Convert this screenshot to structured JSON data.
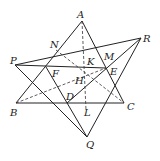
{
  "diagram": {
    "labels": {
      "A": "A",
      "R": "R",
      "N": "N",
      "M": "M",
      "P": "P",
      "K": "K",
      "E": "E",
      "F": "F",
      "H": "H",
      "D": "D",
      "B": "B",
      "L": "L",
      "C": "C",
      "Q": "Q"
    },
    "points": {
      "A": [
        82,
        21
      ],
      "R": [
        141,
        38
      ],
      "P": [
        15,
        65
      ],
      "N": [
        56,
        50
      ],
      "M": [
        106,
        62
      ],
      "K": [
        87,
        66
      ],
      "E": [
        106,
        68
      ],
      "F": [
        46,
        67
      ],
      "H": [
        86,
        76
      ],
      "D": [
        67,
        103
      ],
      "B": [
        16,
        103
      ],
      "L": [
        86,
        103
      ],
      "C": [
        124,
        103
      ],
      "Q": [
        87,
        137
      ]
    },
    "solid_segments": [
      [
        "A",
        "B"
      ],
      [
        "A",
        "C"
      ],
      [
        "B",
        "C"
      ],
      [
        "P",
        "R"
      ],
      [
        "P",
        "E"
      ],
      [
        "P",
        "Q"
      ],
      [
        "R",
        "D"
      ],
      [
        "R",
        "Q"
      ],
      [
        "F",
        "Q"
      ]
    ],
    "dashed_segments": [
      [
        "A",
        "L"
      ],
      [
        "B",
        "E"
      ],
      [
        "N",
        "C"
      ],
      [
        "K",
        "E"
      ]
    ]
  }
}
